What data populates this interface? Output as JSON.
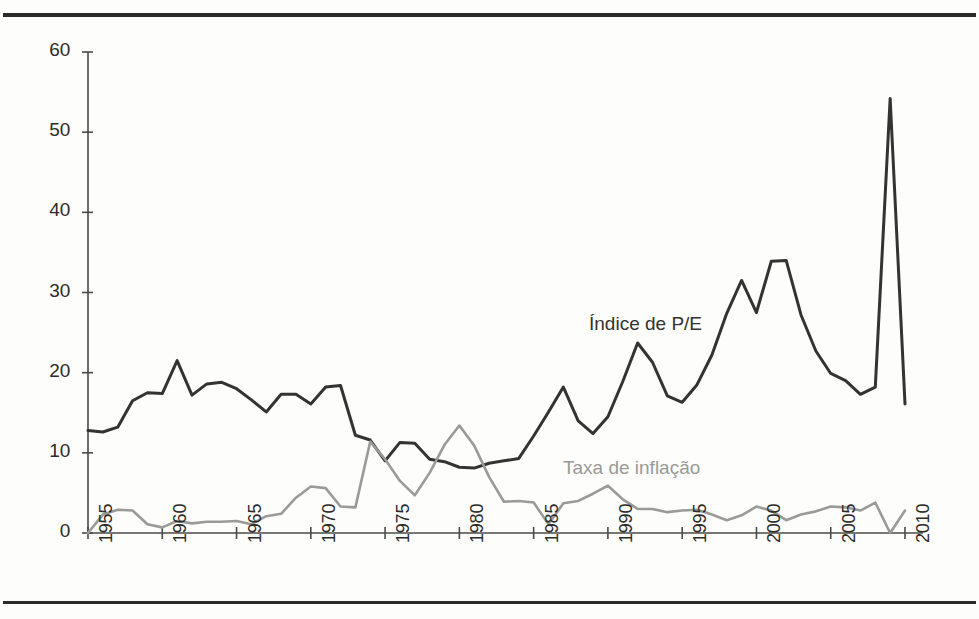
{
  "figure": {
    "background": "#fdfdfc",
    "rule_color": "#2a2a28"
  },
  "chart_data": {
    "type": "line",
    "title": "",
    "subtitle": "",
    "xlabel": "",
    "ylabel": "",
    "xlim": [
      1955,
      2010
    ],
    "ylim": [
      0,
      60
    ],
    "grid": false,
    "legend_position": "inline-annotation",
    "y_ticks": [
      0,
      10,
      20,
      30,
      40,
      50,
      60
    ],
    "y_tick_labels": [
      "0",
      "10",
      "20",
      "30",
      "40",
      "50",
      "60"
    ],
    "x_ticks": [
      1955,
      1960,
      1965,
      1970,
      1975,
      1980,
      1985,
      1990,
      1995,
      2000,
      2005,
      2010
    ],
    "x_tick_labels": [
      "1955",
      "1960",
      "1965",
      "1970",
      "1975",
      "1980",
      "1985",
      "1990",
      "1995",
      "2000",
      "2005",
      "2010"
    ],
    "x": [
      1955,
      1956,
      1957,
      1958,
      1959,
      1960,
      1961,
      1962,
      1963,
      1964,
      1965,
      1966,
      1967,
      1968,
      1969,
      1970,
      1971,
      1972,
      1973,
      1974,
      1975,
      1976,
      1977,
      1978,
      1979,
      1980,
      1981,
      1982,
      1983,
      1984,
      1985,
      1986,
      1987,
      1988,
      1989,
      1990,
      1991,
      1992,
      1993,
      1994,
      1995,
      1996,
      1997,
      1998,
      1999,
      2000,
      2001,
      2002,
      2003,
      2004,
      2005,
      2006,
      2007,
      2008,
      2009,
      2010
    ],
    "series": [
      {
        "name": "Índice de P/E",
        "color": "#33332f",
        "width": 3.0,
        "values": [
          12.8,
          12.6,
          13.2,
          16.5,
          17.5,
          17.4,
          21.5,
          17.2,
          18.6,
          18.8,
          18.0,
          16.6,
          15.1,
          17.3,
          17.3,
          16.1,
          18.2,
          18.4,
          12.2,
          11.6,
          9.0,
          11.3,
          11.2,
          9.2,
          8.9,
          8.2,
          8.1,
          8.7,
          9.0,
          9.3,
          12.1,
          15.1,
          18.2,
          14.0,
          12.4,
          14.5,
          18.9,
          23.7,
          21.3,
          17.1,
          16.3,
          18.5,
          22.2,
          27.4,
          31.5,
          27.5,
          33.9,
          34.0,
          27.2,
          22.7,
          19.9,
          19.0,
          17.3,
          18.2,
          54.2,
          16.1
        ]
      },
      {
        "name": "Taxa de inflação",
        "color": "#9a9a96",
        "width": 2.6,
        "values": [
          0.0,
          2.3,
          2.9,
          2.8,
          1.1,
          0.7,
          1.5,
          1.2,
          1.4,
          1.4,
          1.5,
          1.1,
          2.1,
          2.4,
          4.4,
          5.8,
          5.6,
          3.3,
          3.2,
          11.4,
          9.2,
          6.5,
          4.7,
          7.5,
          11.0,
          13.4,
          10.9,
          7.0,
          3.9,
          4.0,
          3.8,
          1.1,
          3.7,
          4.0,
          4.9,
          5.9,
          4.2,
          3.0,
          3.0,
          2.6,
          2.8,
          2.9,
          2.3,
          1.6,
          2.2,
          3.3,
          2.8,
          1.6,
          2.3,
          2.7,
          3.3,
          3.2,
          2.8,
          3.8,
          0.0,
          2.8
        ]
      }
    ],
    "annotations": [
      {
        "text": "Índice de P/E",
        "color": "#33332f",
        "x_px": 589,
        "y_px": 313
      },
      {
        "text": "Taxa de inflação",
        "color": "#9a9a96",
        "x_px": 563,
        "y_px": 457
      }
    ]
  },
  "axes_geometry": {
    "x0_px": 88,
    "x1_px": 905,
    "y0_px": 533,
    "y60_px": 52
  }
}
